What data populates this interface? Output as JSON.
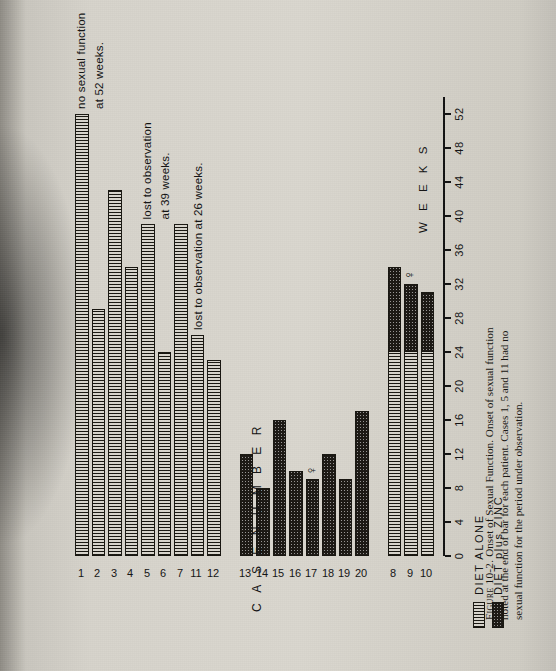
{
  "figure": {
    "caption_lead": "Figure 10-2.",
    "caption_text": "Onset of Sexual Function. Onset of sexual function noted at the end of bar for each patient. Cases 1, 5 and 11 had no sexual function for the period under observation."
  },
  "axes": {
    "x_title": "W E E K S",
    "y_title": "C A S E   N U M B E R",
    "x_ticks": [
      0,
      4,
      8,
      12,
      16,
      20,
      24,
      28,
      32,
      36,
      40,
      44,
      48,
      52
    ],
    "x_min": 0,
    "x_max": 54
  },
  "legend": {
    "items": [
      {
        "label": "DIET ALONE",
        "pattern": "vertical-hatch"
      },
      {
        "label": "DIET plus ZINC",
        "pattern": "stipple"
      }
    ]
  },
  "groups": [
    {
      "name": "GROUP I",
      "roman": "I"
    },
    {
      "name": "GROUP II",
      "roman": "II"
    },
    {
      "name": "GROUP III",
      "roman": "III"
    }
  ],
  "annotations": [
    {
      "id": "case1",
      "text": "no sexual function"
    },
    {
      "id": "case1b",
      "text": "at 52 weeks."
    },
    {
      "id": "case5",
      "text": "lost to observation"
    },
    {
      "id": "case5b",
      "text": "at 39 weeks."
    },
    {
      "id": "case11",
      "text": "lost to observation at 26 weeks."
    }
  ],
  "chart_data": {
    "type": "bar",
    "orientation": "horizontal",
    "title": "Onset of Sexual Function",
    "xlabel": "WEEKS",
    "ylabel": "CASE NUMBER",
    "xlim": [
      0,
      54
    ],
    "grid": false,
    "legend_position": "bottom-left",
    "series": [
      {
        "name": "DIET ALONE",
        "pattern": "vertical-hatch"
      },
      {
        "name": "DIET plus ZINC",
        "pattern": "stipple"
      }
    ],
    "bars": [
      {
        "case": "1",
        "group": "GROUP I",
        "diet_alone": 52,
        "diet_zinc": 0,
        "total": 52,
        "note": "no sexual function at 52 weeks."
      },
      {
        "case": "2",
        "group": "GROUP I",
        "diet_alone": 29,
        "diet_zinc": 0,
        "total": 29
      },
      {
        "case": "3",
        "group": "GROUP I",
        "diet_alone": 43,
        "diet_zinc": 0,
        "total": 43
      },
      {
        "case": "4",
        "group": "GROUP I",
        "diet_alone": 34,
        "diet_zinc": 0,
        "total": 34
      },
      {
        "case": "5",
        "group": "GROUP I",
        "diet_alone": 39,
        "diet_zinc": 0,
        "total": 39,
        "note": "lost to observation at 39 weeks."
      },
      {
        "case": "6",
        "group": "GROUP I",
        "diet_alone": 24,
        "diet_zinc": 0,
        "total": 24
      },
      {
        "case": "7",
        "group": "GROUP I",
        "diet_alone": 39,
        "diet_zinc": 0,
        "total": 39
      },
      {
        "case": "11",
        "group": "GROUP I",
        "diet_alone": 26,
        "diet_zinc": 0,
        "total": 26,
        "note": "lost to observation at 26 weeks."
      },
      {
        "case": "12",
        "group": "GROUP I",
        "diet_alone": 23,
        "diet_zinc": 0,
        "total": 23
      },
      {
        "case": "13",
        "group": "GROUP II",
        "diet_alone": 0,
        "diet_zinc": 12,
        "total": 12
      },
      {
        "case": "14",
        "group": "GROUP II",
        "diet_alone": 0,
        "diet_zinc": 8,
        "total": 8
      },
      {
        "case": "15",
        "group": "GROUP II",
        "diet_alone": 0,
        "diet_zinc": 16,
        "total": 16
      },
      {
        "case": "16",
        "group": "GROUP II",
        "diet_alone": 0,
        "diet_zinc": 10,
        "total": 10
      },
      {
        "case": "17",
        "group": "GROUP II",
        "diet_alone": 0,
        "diet_zinc": 9,
        "total": 9,
        "death_marker": true
      },
      {
        "case": "18",
        "group": "GROUP II",
        "diet_alone": 0,
        "diet_zinc": 12,
        "total": 12
      },
      {
        "case": "19",
        "group": "GROUP II",
        "diet_alone": 0,
        "diet_zinc": 9,
        "total": 9
      },
      {
        "case": "20",
        "group": "GROUP II",
        "diet_alone": 0,
        "diet_zinc": 17,
        "total": 17
      },
      {
        "case": "8",
        "group": "GROUP III",
        "diet_alone": 24,
        "diet_zinc": 10,
        "total": 34
      },
      {
        "case": "9",
        "group": "GROUP III",
        "diet_alone": 24,
        "diet_zinc": 8,
        "total": 32,
        "death_marker": true
      },
      {
        "case": "10",
        "group": "GROUP III",
        "diet_alone": 24,
        "diet_zinc": 7,
        "total": 31
      }
    ]
  }
}
